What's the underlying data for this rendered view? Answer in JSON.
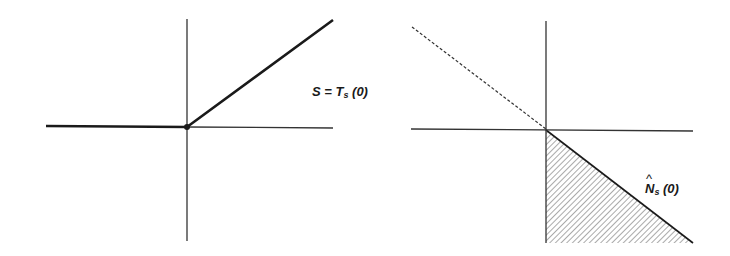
{
  "left_diagram": {
    "label": {
      "main": "S = T",
      "subscript": "s",
      "arg": " (0)"
    },
    "axes": {
      "origin": [
        187,
        127
      ],
      "x_range": [
        46,
        333
      ],
      "y_range": [
        19,
        241
      ]
    },
    "curve": {
      "style": "solid-thick",
      "points": [
        [
          46,
          126
        ],
        [
          187,
          127
        ],
        [
          333,
          20
        ]
      ]
    },
    "origin_marker": "dot"
  },
  "right_diagram": {
    "label": {
      "hat": "^",
      "main": "N",
      "subscript": "s",
      "arg": " (0)"
    },
    "axes": {
      "origin": [
        546,
        130
      ],
      "x_range": [
        411,
        693
      ],
      "y_range": [
        21,
        243
      ]
    },
    "dashed_line": {
      "points": [
        [
          412,
          27
        ],
        [
          546,
          129
        ]
      ]
    },
    "hatched_region": {
      "points": [
        [
          546,
          130
        ],
        [
          546,
          243
        ],
        [
          693,
          243
        ]
      ]
    }
  },
  "colors": {
    "line": "#1a1a1a",
    "axis": "#333333",
    "hatch": "#555555",
    "background": "#ffffff"
  }
}
